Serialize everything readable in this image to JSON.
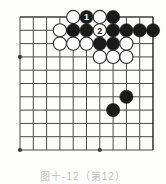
{
  "figure": {
    "kind": "go-board-diagram",
    "caption": "图十-12（第12）",
    "board": {
      "columns": 11,
      "rows": 11,
      "origin_x": 20,
      "origin_y": 17,
      "spacing": 13.3,
      "line_color": "#4a4a4a",
      "edge_line_color": "#3a3a3a",
      "background": "#fdfdfc",
      "stone_radius": 6.6,
      "black_color": "#1a1a1a",
      "white_color": "#ffffff",
      "white_border_color": "#2b2b2b",
      "label_color": "#ffffff",
      "star_points": [
        {
          "col": 0,
          "row": 3
        },
        {
          "col": 0,
          "row": 10
        },
        {
          "col": 6,
          "row": 10
        }
      ],
      "stones": [
        {
          "col": 4,
          "row": 0,
          "color": "white",
          "label": ""
        },
        {
          "col": 5,
          "row": 0,
          "color": "black",
          "label": "1"
        },
        {
          "col": 6,
          "row": 0,
          "color": "white",
          "label": ""
        },
        {
          "col": 7,
          "row": 0,
          "color": "black",
          "label": ""
        },
        {
          "col": 3,
          "row": 1,
          "color": "white",
          "label": ""
        },
        {
          "col": 4,
          "row": 1,
          "color": "black",
          "label": ""
        },
        {
          "col": 5,
          "row": 1,
          "color": "black",
          "label": ""
        },
        {
          "col": 6,
          "row": 1,
          "color": "white",
          "label": "2"
        },
        {
          "col": 7,
          "row": 1,
          "color": "black",
          "label": ""
        },
        {
          "col": 8,
          "row": 1,
          "color": "black",
          "label": ""
        },
        {
          "col": 9,
          "row": 1,
          "color": "black",
          "label": ""
        },
        {
          "col": 10,
          "row": 1,
          "color": "black",
          "label": ""
        },
        {
          "col": 3,
          "row": 2,
          "color": "white",
          "label": ""
        },
        {
          "col": 4,
          "row": 2,
          "color": "white",
          "label": ""
        },
        {
          "col": 5,
          "row": 2,
          "color": "white",
          "label": ""
        },
        {
          "col": 6,
          "row": 2,
          "color": "black",
          "label": ""
        },
        {
          "col": 7,
          "row": 2,
          "color": "black",
          "label": ""
        },
        {
          "col": 8,
          "row": 2,
          "color": "white",
          "label": ""
        },
        {
          "col": 6,
          "row": 3,
          "color": "white",
          "label": ""
        },
        {
          "col": 7,
          "row": 3,
          "color": "white",
          "label": ""
        },
        {
          "col": 8,
          "row": 3,
          "color": "white",
          "label": ""
        },
        {
          "col": 8,
          "row": 6,
          "color": "black",
          "label": ""
        },
        {
          "col": 7,
          "row": 7,
          "color": "black",
          "label": ""
        }
      ]
    }
  }
}
